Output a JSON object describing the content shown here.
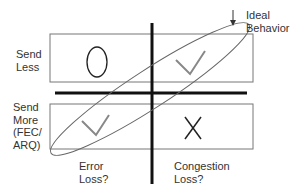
{
  "diagram": {
    "row_labels": {
      "top": [
        "Send",
        "Less"
      ],
      "bottom": [
        "Send",
        "More",
        "(FEC/",
        "ARQ)"
      ]
    },
    "column_labels": {
      "left": [
        "Error",
        "Loss?"
      ],
      "right": [
        "Congestion",
        "Loss?"
      ]
    },
    "annotation": {
      "lines": [
        "Ideal",
        "Behavior"
      ],
      "arrow": "down-arrow"
    },
    "cells": {
      "top_left": "circle",
      "top_right": "checkmark",
      "bottom_left": "checkmark",
      "bottom_right": "cross"
    },
    "colors": {
      "axis": "#111111",
      "box": "#777777",
      "ellipse": "#666666",
      "mark": "#888888",
      "symbol": "#222222"
    }
  }
}
